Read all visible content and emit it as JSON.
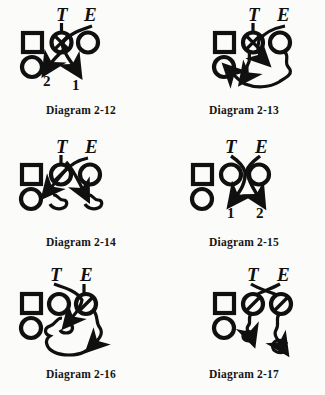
{
  "page": {
    "background_color": "#fbfbf9",
    "ink_color": "#101010",
    "columns": 2,
    "rows": 3
  },
  "legend": {
    "square_symbol": "square",
    "circle_symbol": "circle",
    "circled_x_symbol": "circled-x",
    "label_tackle": "T",
    "label_end": "E",
    "wavy_line_meaning": "wavy-path",
    "straight_line_meaning": "straight-path"
  },
  "diagrams": [
    {
      "id": "2-12",
      "caption": "Diagram 2-12",
      "position": {
        "row": 1,
        "col": 1
      },
      "labels": [
        "T",
        "E"
      ],
      "gap_numbers": [
        "2",
        "1"
      ],
      "players": [
        {
          "shape": "square",
          "name": "guard-square"
        },
        {
          "shape": "circled-x",
          "name": "center-circled-x"
        },
        {
          "shape": "circle",
          "name": "right-circle"
        },
        {
          "shape": "circle",
          "name": "lower-left-circle"
        }
      ],
      "paths": [
        {
          "from": "T",
          "to": "2",
          "style": "straight",
          "arrow": true
        },
        {
          "from": "E",
          "to": "1",
          "style": "straight",
          "arrow": true
        }
      ]
    },
    {
      "id": "2-13",
      "caption": "Diagram 2-13",
      "position": {
        "row": 1,
        "col": 2
      },
      "labels": [
        "T",
        "E"
      ],
      "gap_numbers": [],
      "players": [
        {
          "shape": "square",
          "name": "guard-square"
        },
        {
          "shape": "circled-x",
          "name": "center-circled-x"
        },
        {
          "shape": "circle",
          "name": "right-circle"
        },
        {
          "shape": "circle",
          "name": "lower-left-circle"
        }
      ],
      "paths": [
        {
          "from": "T",
          "to": "right-inside",
          "style": "straight",
          "arrow": true
        },
        {
          "from": "E",
          "to": "lower-left-circle",
          "style": "wavy",
          "arrow": true
        }
      ]
    },
    {
      "id": "2-14",
      "caption": "Diagram 2-14",
      "position": {
        "row": 2,
        "col": 1
      },
      "labels": [
        "T",
        "E"
      ],
      "gap_numbers": [],
      "players": [
        {
          "shape": "square",
          "name": "guard-square"
        },
        {
          "shape": "circle",
          "name": "center-slash-circle"
        },
        {
          "shape": "circle",
          "name": "right-circle"
        },
        {
          "shape": "circle",
          "name": "lower-left-circle"
        }
      ],
      "paths": [
        {
          "from": "T",
          "to": "left-gap",
          "style": "wavy",
          "arrow": true
        },
        {
          "from": "E",
          "to": "middle-gap",
          "style": "wavy",
          "arrow": true
        }
      ]
    },
    {
      "id": "2-15",
      "caption": "Diagram 2-15",
      "position": {
        "row": 2,
        "col": 2
      },
      "labels": [
        "T",
        "E"
      ],
      "gap_numbers": [
        "1",
        "2"
      ],
      "players": [
        {
          "shape": "square",
          "name": "guard-square"
        },
        {
          "shape": "circle",
          "name": "center-circle"
        },
        {
          "shape": "circle",
          "name": "right-circle"
        },
        {
          "shape": "circle",
          "name": "lower-left-circle"
        }
      ],
      "paths": [
        {
          "from": "T",
          "to": "1",
          "style": "straight",
          "arrow": true
        },
        {
          "from": "E",
          "to": "2",
          "style": "straight",
          "arrow": true
        }
      ]
    },
    {
      "id": "2-16",
      "caption": "Diagram 2-16",
      "position": {
        "row": 3,
        "col": 1
      },
      "labels": [
        "T",
        "E"
      ],
      "gap_numbers": [],
      "players": [
        {
          "shape": "square",
          "name": "guard-square"
        },
        {
          "shape": "circle",
          "name": "center-circle"
        },
        {
          "shape": "circle",
          "name": "right-slash-circle"
        },
        {
          "shape": "circle",
          "name": "lower-left-circle"
        }
      ],
      "paths": [
        {
          "from": "T",
          "to": "inside-gap",
          "style": "straight",
          "arrow": true
        },
        {
          "from": "E",
          "to": "outside-loop",
          "style": "wavy",
          "arrow": true
        }
      ]
    },
    {
      "id": "2-17",
      "caption": "Diagram 2-17",
      "position": {
        "row": 3,
        "col": 2
      },
      "labels": [
        "T",
        "E"
      ],
      "gap_numbers": [],
      "players": [
        {
          "shape": "square",
          "name": "guard-square"
        },
        {
          "shape": "circle",
          "name": "center-slash-circle"
        },
        {
          "shape": "circle",
          "name": "right-slash-circle"
        },
        {
          "shape": "circle",
          "name": "lower-left-circle"
        }
      ],
      "paths": [
        {
          "from": "T",
          "to": "left-loop",
          "style": "wavy",
          "arrow": true
        },
        {
          "from": "E",
          "to": "right-loop",
          "style": "wavy",
          "arrow": true
        }
      ]
    }
  ]
}
